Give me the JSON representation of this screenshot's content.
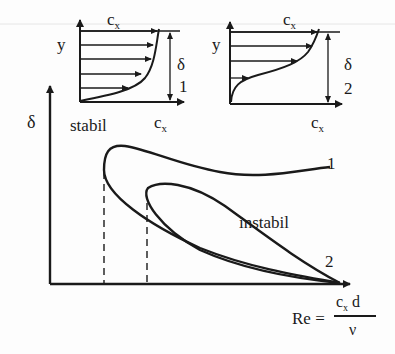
{
  "profile_1": {
    "y_label": "y",
    "x_label_top": "c",
    "x_label_top_sub": "x",
    "x_label_bottom": "c",
    "x_label_bottom_sub": "x",
    "thickness_label": "δ",
    "index_label": "1",
    "arrow_count": 5
  },
  "profile_2": {
    "y_label": "y",
    "x_label_top": "c",
    "x_label_top_sub": "x",
    "x_label_bottom": "c",
    "x_label_bottom_sub": "x",
    "thickness_label": "δ",
    "index_label": "2",
    "arrow_count": 4
  },
  "main_plot": {
    "y_axis_label": "δ",
    "stable_region_label": "stabil",
    "unstable_region_label": "instabil",
    "curve_1_label": "1",
    "curve_2_label": "2",
    "x_axis_formula": {
      "lhs": "Re =",
      "numerator": "c",
      "numerator_sub": "x",
      "numerator_rest": " d",
      "denominator": "ν"
    }
  },
  "colors": {
    "ink": "#1a1a1a",
    "background": "#fdfdfd"
  }
}
